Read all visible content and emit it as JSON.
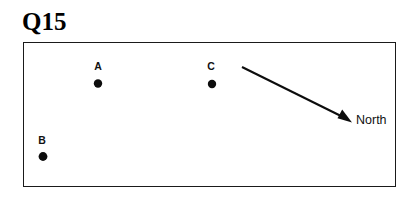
{
  "page": {
    "background_color": "#ffffff",
    "ink_color": "#0d0d0d"
  },
  "title": {
    "text": "Q15"
  },
  "map": {
    "frame": {
      "name": "map-frame",
      "x": 23,
      "y": 42,
      "width": 373,
      "height": 145,
      "border_color": "#1a1a1a"
    },
    "points": [
      {
        "id": "A",
        "label": "A",
        "dot_x": 98,
        "dot_y": 83.5,
        "dot_r": 4.2,
        "label_x": 98,
        "label_y": 70
      },
      {
        "id": "C",
        "label": "C",
        "dot_x": 212,
        "dot_y": 84,
        "dot_r": 4.2,
        "label_x": 211,
        "label_y": 70
      },
      {
        "id": "B",
        "label": "B",
        "dot_x": 43,
        "dot_y": 156.5,
        "dot_r": 4.4,
        "label_x": 42,
        "label_y": 144
      }
    ],
    "north_arrow": {
      "label": "North",
      "tail_x": 242,
      "tail_y": 67,
      "tip_x": 351,
      "tip_y": 121
    }
  }
}
